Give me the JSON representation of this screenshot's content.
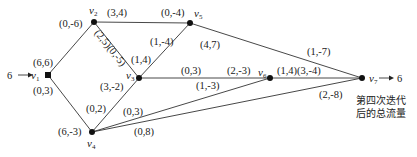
{
  "diagram": {
    "caption_lines": [
      "第四次迭代",
      "后的总流量"
    ],
    "source": {
      "label": "6",
      "arrow": "→"
    },
    "sink": {
      "label": "6",
      "arrow": "→"
    },
    "nodes": [
      {
        "id": "v1",
        "name": "v",
        "sub": "1",
        "x": 48,
        "y": 75
      },
      {
        "id": "v2",
        "name": "v",
        "sub": "2",
        "x": 94,
        "y": 22
      },
      {
        "id": "v3",
        "name": "v",
        "sub": "3",
        "x": 139,
        "y": 78
      },
      {
        "id": "v4",
        "name": "v",
        "sub": "4",
        "x": 92,
        "y": 132
      },
      {
        "id": "v5",
        "name": "v",
        "sub": "5",
        "x": 190,
        "y": 23
      },
      {
        "id": "v6",
        "name": "v",
        "sub": "6",
        "x": 270,
        "y": 78
      },
      {
        "id": "v7",
        "name": "v",
        "sub": "7",
        "x": 362,
        "y": 78
      }
    ],
    "edges": [
      {
        "from": "v1",
        "to": "v2",
        "labels": [
          "(6,6)",
          "(0,-6)"
        ]
      },
      {
        "from": "v1",
        "to": "v4",
        "labels": [
          "(0,3)",
          "(6,-3)"
        ]
      },
      {
        "from": "v2",
        "to": "v5",
        "labels": [
          "(3,4)",
          "(0,-4)"
        ]
      },
      {
        "from": "v2",
        "to": "v3",
        "labels": [
          "(2,5)(0,-5)"
        ]
      },
      {
        "from": "v3",
        "to": "v5",
        "labels": [
          "(1,4)",
          "(1,-4)"
        ]
      },
      {
        "from": "v3",
        "to": "v4",
        "labels": [
          "(3,-2)",
          "(0,2)"
        ]
      },
      {
        "from": "v3",
        "to": "v6",
        "labels": [
          "(0,3)",
          "(2,-3)"
        ]
      },
      {
        "from": "v4",
        "to": "v6",
        "labels": [
          "(0,3)",
          "(1,-3)"
        ]
      },
      {
        "from": "v4",
        "to": "v7",
        "labels": [
          "(0,8)",
          "(2,-8)"
        ]
      },
      {
        "from": "v5",
        "to": "v7",
        "labels": [
          "(4,7)",
          "(1,-7)"
        ]
      },
      {
        "from": "v6",
        "to": "v7",
        "labels": [
          "(1,4)(3,-4)"
        ]
      }
    ]
  },
  "labels": {
    "e12a": "(6,6)",
    "e12b": "(0,-6)",
    "e14a": "(0,3)",
    "e14b": "(6,-3)",
    "e25a": "(3,4)",
    "e25b": "(0,-4)",
    "e23": "(2,5)(0,-5)",
    "e35a": "(1,4)",
    "e35b": "(1,-4)",
    "e34a": "(3,-2)",
    "e34b": "(0,2)",
    "e36a": "(0,3)",
    "e36b": "(2,-3)",
    "e46a": "(0,3)",
    "e46b": "(1,-3)",
    "e47a": "(0,8)",
    "e47b": "(2,-8)",
    "e57a": "(4,7)",
    "e57b": "(1,-7)",
    "e67": "(1,4)(3,-4)",
    "v": "v",
    "s1": "1",
    "s2": "2",
    "s3": "3",
    "s4": "4",
    "s5": "5",
    "s6": "6",
    "s7": "7",
    "src_val": "6",
    "sink_val": "6",
    "cap1": "第四次迭代",
    "cap2": "后的总流量"
  }
}
